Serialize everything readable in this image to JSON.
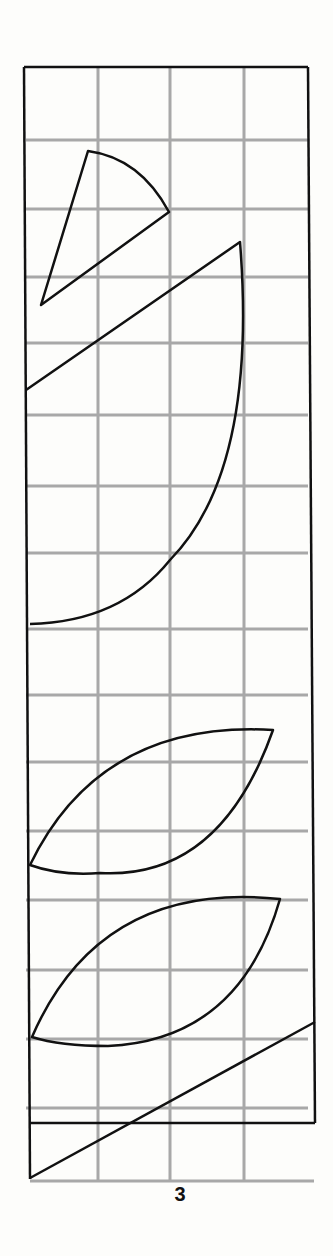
{
  "page": {
    "page_number": "3",
    "grid_color": "#a8a8a8",
    "line_color": "#111111"
  },
  "shapes": [
    {
      "type": "sector",
      "description": "small circular sector pointing down-left"
    },
    {
      "type": "sector",
      "description": "large circular sector / quarter-circle"
    },
    {
      "type": "lens",
      "description": "leaf-shaped lens"
    },
    {
      "type": "lens",
      "description": "leaf-shaped lens"
    },
    {
      "type": "line",
      "description": "diagonal line"
    }
  ]
}
